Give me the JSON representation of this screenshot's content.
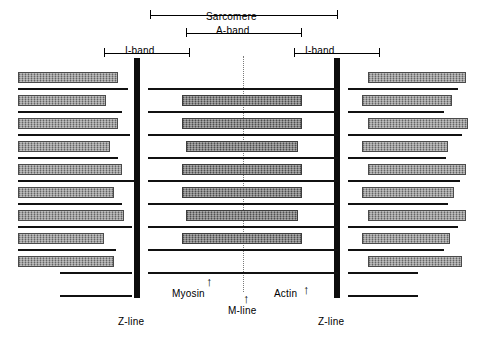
{
  "diagram": {
    "title_labels": {
      "sarcomere": "Sarcomere",
      "a_band": "A-band",
      "i_band_left": "I-band",
      "i_band_right": "I-band"
    },
    "structure_labels": {
      "z_line_left": "Z-line",
      "z_line_right": "Z-line",
      "m_line": "M-line",
      "myosin": "Myosin",
      "actin": "Actin"
    },
    "pointers": {
      "myosin_arrow": "↑",
      "actin_arrow": "↑"
    },
    "colors": {
      "z_line": "#0d0d0d",
      "m_line": "#7a7a7a",
      "actin_filament": "#8a8a8a",
      "myosin_filament": "#6f6f6f",
      "background": "#ffffff",
      "ink": "#000000"
    },
    "left_actin_blocks": [
      {
        "top": 72,
        "left": 18,
        "width": 100
      },
      {
        "top": 95,
        "left": 18,
        "width": 88
      },
      {
        "top": 118,
        "left": 18,
        "width": 100
      },
      {
        "top": 141,
        "left": 18,
        "width": 92
      },
      {
        "top": 164,
        "left": 18,
        "width": 104
      },
      {
        "top": 187,
        "left": 18,
        "width": 96
      },
      {
        "top": 210,
        "left": 18,
        "width": 106
      },
      {
        "top": 233,
        "left": 18,
        "width": 86
      },
      {
        "top": 256,
        "left": 18,
        "width": 96
      }
    ],
    "left_actin_lines": [
      {
        "top": 88,
        "left": 18,
        "width": 110
      },
      {
        "top": 111,
        "left": 18,
        "width": 104
      },
      {
        "top": 134,
        "left": 18,
        "width": 112
      },
      {
        "top": 157,
        "left": 18,
        "width": 100
      },
      {
        "top": 180,
        "left": 18,
        "width": 116
      },
      {
        "top": 203,
        "left": 18,
        "width": 104
      },
      {
        "top": 226,
        "left": 18,
        "width": 114
      },
      {
        "top": 249,
        "left": 18,
        "width": 98
      },
      {
        "top": 272,
        "left": 60,
        "width": 72
      },
      {
        "top": 295,
        "left": 60,
        "width": 72
      }
    ],
    "right_actin_blocks": [
      {
        "top": 72,
        "left": 368,
        "width": 98
      },
      {
        "top": 95,
        "left": 362,
        "width": 90
      },
      {
        "top": 118,
        "left": 368,
        "width": 100
      },
      {
        "top": 141,
        "left": 362,
        "width": 86
      },
      {
        "top": 164,
        "left": 368,
        "width": 98
      },
      {
        "top": 187,
        "left": 362,
        "width": 92
      },
      {
        "top": 210,
        "left": 368,
        "width": 98
      },
      {
        "top": 233,
        "left": 362,
        "width": 88
      },
      {
        "top": 256,
        "left": 368,
        "width": 94
      }
    ],
    "right_actin_lines": [
      {
        "top": 88,
        "left": 348,
        "width": 110
      },
      {
        "top": 111,
        "left": 348,
        "width": 96
      },
      {
        "top": 134,
        "left": 348,
        "width": 114
      },
      {
        "top": 157,
        "left": 348,
        "width": 98
      },
      {
        "top": 180,
        "left": 348,
        "width": 112
      },
      {
        "top": 203,
        "left": 348,
        "width": 100
      },
      {
        "top": 226,
        "left": 348,
        "width": 110
      },
      {
        "top": 249,
        "left": 348,
        "width": 96
      },
      {
        "top": 272,
        "left": 348,
        "width": 70
      },
      {
        "top": 295,
        "left": 348,
        "width": 70
      }
    ],
    "myosin_blocks": [
      {
        "top": 95,
        "left": 182,
        "width": 120
      },
      {
        "top": 118,
        "left": 182,
        "width": 120
      },
      {
        "top": 141,
        "left": 186,
        "width": 112
      },
      {
        "top": 164,
        "left": 182,
        "width": 120
      },
      {
        "top": 187,
        "left": 182,
        "width": 120
      },
      {
        "top": 210,
        "left": 186,
        "width": 112
      },
      {
        "top": 233,
        "left": 182,
        "width": 120
      }
    ],
    "myosin_lines": [
      {
        "top": 111,
        "left": 148,
        "width": 190
      },
      {
        "top": 134,
        "left": 148,
        "width": 190
      },
      {
        "top": 157,
        "left": 148,
        "width": 190
      },
      {
        "top": 180,
        "left": 148,
        "width": 190
      },
      {
        "top": 203,
        "left": 148,
        "width": 190
      },
      {
        "top": 226,
        "left": 148,
        "width": 190
      },
      {
        "top": 249,
        "left": 148,
        "width": 190
      },
      {
        "top": 272,
        "left": 148,
        "width": 190
      },
      {
        "top": 88,
        "left": 148,
        "width": 190
      }
    ]
  }
}
